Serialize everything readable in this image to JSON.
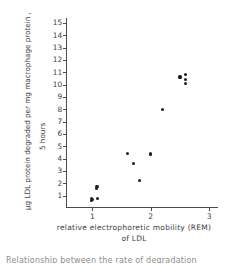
{
  "figure": {
    "background_color": "#ffffff",
    "ink_color": "#1d1d1d",
    "axis_color": "#4a4a4a",
    "caption_partial": "Relationship between the rate of degradation"
  },
  "chart_data": {
    "type": "scatter",
    "title": "",
    "xlabel": "relative electrophoretic mobility  (REM)",
    "xlabel_line2": "of LDL",
    "ylabel": "µg LDL protein degraded per  mg  macrophage  protein ,",
    "ylabel_line2": "5 hours",
    "xlim": [
      0.55,
      3.15
    ],
    "ylim": [
      0,
      15.4
    ],
    "xticks": [
      1,
      2,
      3
    ],
    "xtick_labels": [
      "1",
      "2",
      "3"
    ],
    "yticks": [
      1,
      2,
      3,
      4,
      5,
      6,
      7,
      8,
      9,
      10,
      11,
      12,
      13,
      14,
      15
    ],
    "ytick_labels": [
      "1",
      "2",
      "3",
      "4",
      "5",
      "6",
      "7",
      "8",
      "9",
      "10",
      "11",
      "12",
      "13",
      "14",
      "15"
    ],
    "grid": false,
    "legend": null,
    "marker": "filled-circle",
    "points": [
      {
        "x": 0.98,
        "y": 0.62
      },
      {
        "x": 0.99,
        "y": 0.78
      },
      {
        "x": 1.0,
        "y": 0.7
      },
      {
        "x": 1.09,
        "y": 0.8
      },
      {
        "x": 1.07,
        "y": 1.55
      },
      {
        "x": 1.08,
        "y": 1.72
      },
      {
        "x": 1.6,
        "y": 4.4
      },
      {
        "x": 1.71,
        "y": 3.58
      },
      {
        "x": 1.8,
        "y": 2.25
      },
      {
        "x": 2.0,
        "y": 4.38
      },
      {
        "x": 2.2,
        "y": 8.02
      },
      {
        "x": 2.5,
        "y": 10.62
      },
      {
        "x": 2.6,
        "y": 10.8
      },
      {
        "x": 2.6,
        "y": 10.42
      },
      {
        "x": 2.6,
        "y": 10.1
      }
    ]
  }
}
